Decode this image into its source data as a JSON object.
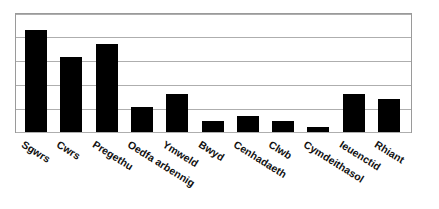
{
  "chart_data": {
    "type": "bar",
    "title": "",
    "subtitle": "",
    "xlabel": "",
    "ylabel": "",
    "categories": [
      "Sgwrs",
      "Cwrs",
      "Pregethu",
      "Oedfa arbennig",
      "Ymweld",
      "Bwyd",
      "Cenhadaeth",
      "Clwb",
      "Cymdeithasol",
      "Ieuenctid",
      "Rhiant"
    ],
    "values": [
      4.33,
      3.17,
      3.75,
      1.04,
      1.63,
      0.46,
      0.67,
      0.46,
      0.21,
      1.63,
      1.38
    ],
    "ylim": [
      0,
      5
    ],
    "yticks": [
      0,
      1,
      2,
      3,
      4,
      5
    ],
    "ytick_labels": [
      "",
      "",
      "",
      "",
      "",
      ""
    ],
    "xtick_labels": [
      "Sgwrs",
      "Cwrs",
      "Pregethu",
      "Oedfa arbennig",
      "Ymweld",
      "Bwyd",
      "Cenhadaeth",
      "Clwb",
      "Cymdeithasol",
      "Ieuenctid",
      "Rhiant"
    ],
    "grid": true,
    "grid_axis": "y",
    "legend": false,
    "legend_position": "none",
    "annotations": [],
    "bar_color": "#000000",
    "grid_color": "#AEAEAE",
    "frame_color": "#9A9A9A",
    "background_color": "#FFFFFF",
    "label_rotation_degrees": 32
  },
  "figure": {
    "width_px": 439,
    "height_px": 209
  }
}
